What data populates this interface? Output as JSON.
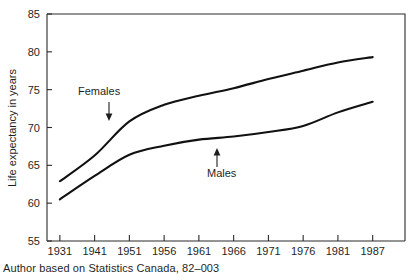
{
  "caption": "Author based on Statistics Canada, 82–003",
  "annotations": {
    "females": {
      "label": "Females",
      "arrow": "down-arrow-icon"
    },
    "males": {
      "label": "Males",
      "arrow": "up-arrow-icon"
    }
  },
  "chart_data": {
    "type": "line",
    "title": "",
    "subtitle": "",
    "xlabel": "",
    "ylabel": "Life expectancy in years",
    "x": [
      1931,
      1941,
      1951,
      1956,
      1961,
      1966,
      1971,
      1976,
      1981,
      1987
    ],
    "xtick_labels": [
      "1931",
      "1941",
      "1951",
      "1956",
      "1961",
      "1966",
      "1971",
      "1976",
      "1981",
      "1987"
    ],
    "ytick_labels": [
      "55",
      "60",
      "65",
      "70",
      "75",
      "80",
      "85"
    ],
    "yticks": [
      55,
      60,
      65,
      70,
      75,
      80,
      85
    ],
    "ylim": [
      55,
      85
    ],
    "grid": false,
    "legend_position": "inline-annotations",
    "series": [
      {
        "name": "Females",
        "values": [
          62.9,
          66.3,
          70.8,
          73.0,
          74.2,
          75.2,
          76.4,
          77.5,
          78.6,
          79.3
        ]
      },
      {
        "name": "Males",
        "values": [
          60.5,
          63.6,
          66.4,
          67.6,
          68.4,
          68.8,
          69.4,
          70.2,
          72.0,
          73.4
        ]
      }
    ],
    "source_note": "Author based on Statistics Canada, 82–003"
  }
}
